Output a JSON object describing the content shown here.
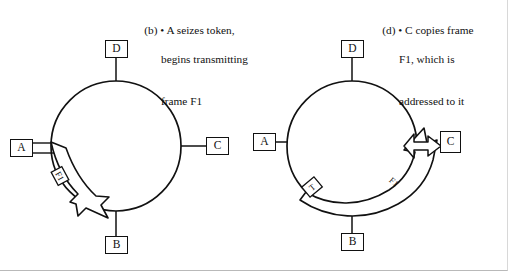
{
  "figure": {
    "background_color": "#ffffff",
    "line_color": "#111111"
  },
  "panels": [
    {
      "id": "b",
      "caption": {
        "label": "(b)",
        "bullet": "•",
        "line1": "(b) • A seizes token,",
        "line2": "begins transmitting",
        "line3": "frame F1"
      },
      "ring": {
        "cx": 116,
        "cy": 146,
        "r": 65
      },
      "nodes": [
        {
          "name": "D",
          "label": "D",
          "x": 105,
          "y": 22,
          "position": "top"
        },
        {
          "name": "A",
          "label": "A",
          "x": 10,
          "y": 137,
          "position": "left"
        },
        {
          "name": "C",
          "label": "C",
          "x": 207,
          "y": 133,
          "position": "right"
        },
        {
          "name": "B",
          "label": "B",
          "x": 110,
          "y": 237,
          "position": "bottom"
        }
      ],
      "frame_band": {
        "label": "F1",
        "from_node": "A",
        "direction": "clockwise-downward"
      },
      "token_marker": null
    },
    {
      "id": "d",
      "caption": {
        "label": "(d)",
        "bullet": "•",
        "line1": "(d) • C copies frame",
        "line2": "F1, which is",
        "line3": "addressed to it"
      },
      "ring": {
        "cx": 352,
        "cy": 146,
        "r": 65
      },
      "nodes": [
        {
          "name": "D",
          "label": "D",
          "x": 341,
          "y": 22,
          "position": "top"
        },
        {
          "name": "A",
          "label": "A",
          "x": 253,
          "y": 133,
          "position": "left"
        },
        {
          "name": "C",
          "label": "C",
          "x": 440,
          "y": 131,
          "position": "right"
        },
        {
          "name": "B",
          "label": "B",
          "x": 341,
          "y": 234,
          "position": "bottom"
        }
      ],
      "frame_band": {
        "label": "F1",
        "direction": "clockwise-upward"
      },
      "token_marker": {
        "label": "T"
      },
      "copy_arrow": {
        "to_node": "C",
        "description": "frame copied to C"
      }
    }
  ]
}
